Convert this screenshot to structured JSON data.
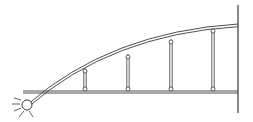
{
  "diagram": {
    "title": "Half-arch with hangers supporting a deck",
    "type": "structural-schematic",
    "colors": {
      "line": "#3a3a3a",
      "background": "#ffffff",
      "node_fill": "#ffffff"
    },
    "support": {
      "kind": "pin",
      "x": 27,
      "y": 105,
      "r": 5
    },
    "wall": {
      "x": 238,
      "y_top": 5,
      "y_bottom": 113
    },
    "deck": {
      "x_start": 23,
      "x_end": 238,
      "y_top": 91,
      "y_bottom": 93
    },
    "arch": {
      "start": [
        27,
        105
      ],
      "control": [
        110,
        32
      ],
      "end": [
        238,
        24
      ],
      "gap": 2.2
    },
    "hangers": [
      {
        "x": 85,
        "y_top": 71,
        "y_bottom": 89
      },
      {
        "x": 128,
        "y_top": 57,
        "y_bottom": 89
      },
      {
        "x": 171,
        "y_top": 42,
        "y_bottom": 89
      },
      {
        "x": 213,
        "y_top": 31,
        "y_bottom": 89
      }
    ],
    "hanger_count": 4
  }
}
